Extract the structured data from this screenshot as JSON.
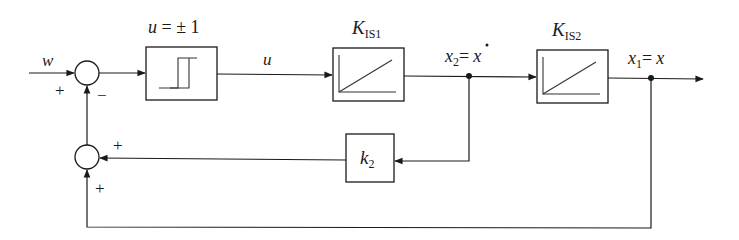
{
  "diagram": {
    "type": "block-diagram",
    "title": "",
    "signals": {
      "input": "w",
      "relay_output": "u",
      "x2_var": "x",
      "x2_sub": "2",
      "x2_eq": "=",
      "x2_rhs": "x",
      "x1_var": "x",
      "x1_sub": "1",
      "x1_eq": "=",
      "x1_rhs": "x"
    },
    "blocks": {
      "relay": {
        "label_var": "u",
        "label_rest": " = ± 1"
      },
      "integrator1": {
        "label_main": "K",
        "label_sub": "IS1"
      },
      "integrator2": {
        "label_main": "K",
        "label_sub": "IS2"
      },
      "feedback_gain": {
        "label_main": "k",
        "label_sub": "2"
      }
    },
    "junctions": {
      "sum1": {
        "sign_input": "+",
        "sign_feedback": "−"
      },
      "sum2": {
        "sign_k2": "+",
        "sign_x1": "+"
      }
    }
  }
}
